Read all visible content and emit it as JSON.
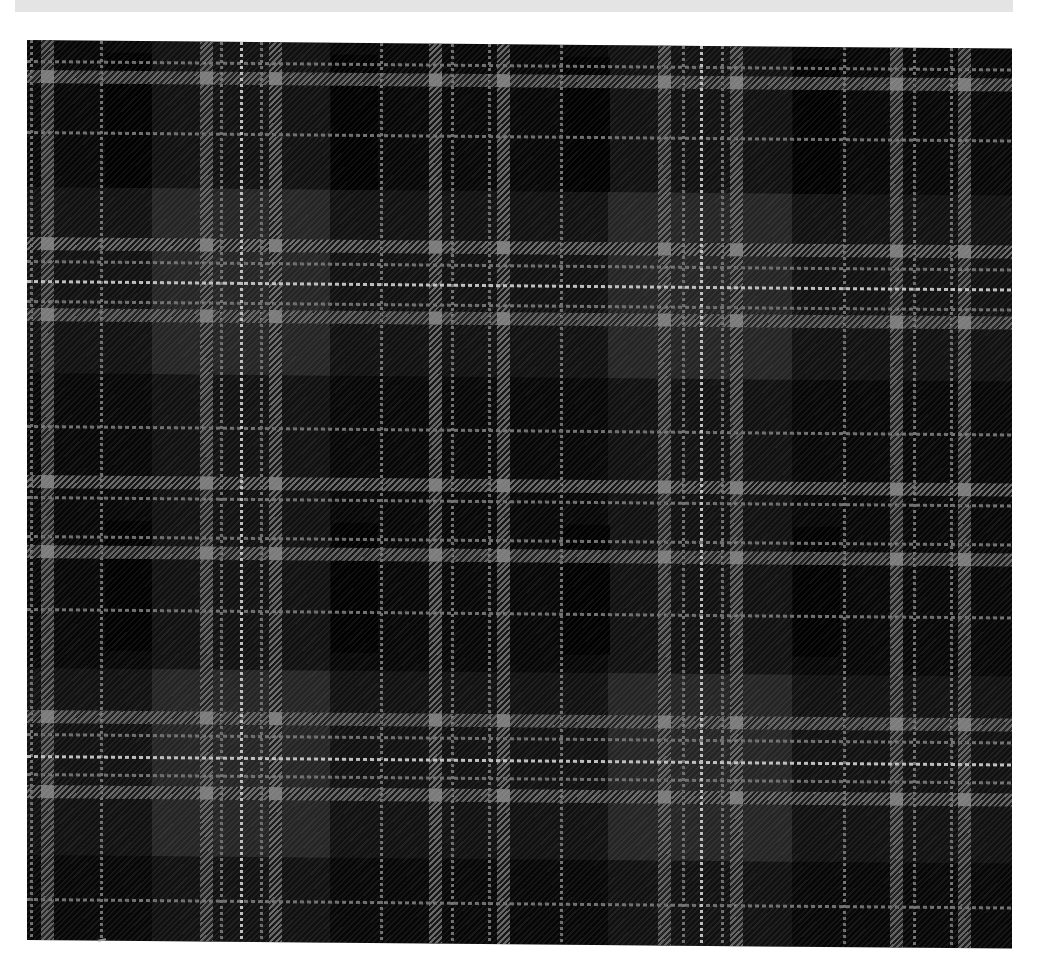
{
  "caption": {
    "text": "",
    "note": "caption text cropped — only descenders visible"
  },
  "image": {
    "subject": "Grey and black tartan fabric",
    "colors": {
      "ground": "#070707",
      "light_block": "#262626",
      "dark_block": "#000000",
      "grey_stripe": "#737373",
      "thin_line": "#6d6d6d",
      "white_line": "#bdbdbd",
      "caption_strip": "#e4e4e4"
    },
    "light_blocks": {
      "columns": [
        [
          125,
          303
        ],
        [
          581,
          765
        ]
      ],
      "rows": [
        [
          147,
          333
        ],
        [
          628,
          815
        ]
      ]
    },
    "dark_blocks": [
      [
        78,
        12,
        47,
        135
      ],
      [
        304,
        12,
        47,
        135
      ],
      [
        536,
        12,
        47,
        135
      ],
      [
        766,
        12,
        47,
        135
      ],
      [
        78,
        480,
        47,
        130
      ],
      [
        304,
        480,
        47,
        130
      ],
      [
        536,
        480,
        47,
        130
      ],
      [
        766,
        480,
        47,
        130
      ]
    ],
    "grey_bands_x": [
      14,
      173,
      242,
      402,
      470,
      631,
      703,
      863,
      931
    ],
    "grey_bands_y": [
      30,
      197,
      268,
      435,
      505,
      670,
      745
    ],
    "thin_lines_x": [
      3,
      73,
      193,
      233,
      353,
      424,
      461,
      533,
      655,
      694,
      816,
      886,
      923
    ],
    "white_lines_x": [
      213,
      673
    ],
    "thin_lines_y": [
      20,
      91,
      220,
      260,
      385,
      456,
      495,
      568,
      693,
      733,
      858
    ],
    "white_lines_y": [
      240,
      715
    ]
  }
}
